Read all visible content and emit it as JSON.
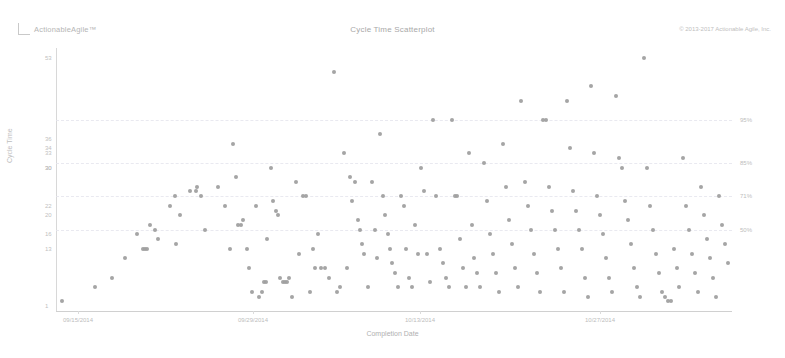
{
  "header": {
    "logo_text": "ActionableAgile™",
    "title": "Cycle Time Scatterplot",
    "copyright": "© 2013-2017 Actionable Agile, Inc."
  },
  "chart_data": {
    "type": "scatter",
    "title": "Cycle Time Scatterplot",
    "xlabel": "Completion Date",
    "ylabel": "Cycle Time",
    "grid": true,
    "legend": "none",
    "xlim": [
      "09/15/2014",
      "11/10/2014"
    ],
    "ylim": [
      0,
      55
    ],
    "x_tick_labels": [
      "09/15/2014",
      "09/29/2014",
      "10/13/2014",
      "10/27/2014"
    ],
    "x_tick_positions": [
      78,
      253,
      420,
      600
    ],
    "y_tick_labels": [
      "53",
      "36",
      "34",
      "30",
      "33",
      "30",
      "22",
      "20",
      "16",
      "13",
      "1"
    ],
    "y_tick_values": [
      53,
      36,
      34,
      30,
      33,
      30,
      22,
      20,
      16,
      13,
      1
    ],
    "percentile_lines": [
      {
        "label": "95%",
        "value": 40
      },
      {
        "label": "85%",
        "value": 31
      },
      {
        "label": "71%",
        "value": 24
      },
      {
        "label": "50%",
        "value": 17
      }
    ],
    "marker_color": "#a0a0a0",
    "marker_size": 4,
    "point_count": 178,
    "points": [
      [
        62,
        2
      ],
      [
        95,
        5
      ],
      [
        112,
        7
      ],
      [
        125,
        11
      ],
      [
        137,
        16
      ],
      [
        143,
        13
      ],
      [
        145,
        13
      ],
      [
        147,
        13
      ],
      [
        150,
        18
      ],
      [
        155,
        17
      ],
      [
        158,
        15
      ],
      [
        170,
        22
      ],
      [
        175,
        24
      ],
      [
        176,
        14
      ],
      [
        180,
        20
      ],
      [
        190,
        25
      ],
      [
        196,
        25
      ],
      [
        197,
        26
      ],
      [
        201,
        24
      ],
      [
        205,
        17
      ],
      [
        218,
        26
      ],
      [
        225,
        22
      ],
      [
        230,
        13
      ],
      [
        233,
        35
      ],
      [
        236,
        28
      ],
      [
        238,
        18
      ],
      [
        241,
        18
      ],
      [
        243,
        19
      ],
      [
        247,
        13
      ],
      [
        249,
        9
      ],
      [
        252,
        4
      ],
      [
        256,
        22
      ],
      [
        259,
        3
      ],
      [
        262,
        4
      ],
      [
        264,
        6
      ],
      [
        266,
        6
      ],
      [
        267,
        15
      ],
      [
        271,
        30
      ],
      [
        273,
        23
      ],
      [
        276,
        21
      ],
      [
        278,
        20
      ],
      [
        280,
        7
      ],
      [
        283,
        6
      ],
      [
        285,
        6
      ],
      [
        287,
        6
      ],
      [
        289,
        7
      ],
      [
        292,
        3
      ],
      [
        296,
        27
      ],
      [
        299,
        12
      ],
      [
        303,
        24
      ],
      [
        306,
        24
      ],
      [
        310,
        4
      ],
      [
        313,
        13
      ],
      [
        315,
        9
      ],
      [
        318,
        16
      ],
      [
        321,
        9
      ],
      [
        325,
        9
      ],
      [
        329,
        7
      ],
      [
        334,
        50
      ],
      [
        337,
        4
      ],
      [
        340,
        5
      ],
      [
        344,
        33
      ],
      [
        347,
        9
      ],
      [
        350,
        28
      ],
      [
        352,
        23
      ],
      [
        355,
        27
      ],
      [
        358,
        19
      ],
      [
        360,
        17
      ],
      [
        362,
        14
      ],
      [
        364,
        12
      ],
      [
        368,
        5
      ],
      [
        372,
        27
      ],
      [
        375,
        17
      ],
      [
        377,
        11
      ],
      [
        380,
        37
      ],
      [
        383,
        24
      ],
      [
        385,
        20
      ],
      [
        388,
        16
      ],
      [
        390,
        13
      ],
      [
        392,
        10
      ],
      [
        395,
        8
      ],
      [
        398,
        5
      ],
      [
        401,
        24
      ],
      [
        404,
        22
      ],
      [
        406,
        13
      ],
      [
        409,
        7
      ],
      [
        412,
        5
      ],
      [
        415,
        18
      ],
      [
        418,
        12
      ],
      [
        421,
        30
      ],
      [
        424,
        25
      ],
      [
        427,
        12
      ],
      [
        430,
        6
      ],
      [
        433,
        40
      ],
      [
        436,
        24
      ],
      [
        440,
        13
      ],
      [
        443,
        10
      ],
      [
        446,
        7
      ],
      [
        449,
        5
      ],
      [
        452,
        40
      ],
      [
        455,
        24
      ],
      [
        457,
        24
      ],
      [
        460,
        15
      ],
      [
        463,
        9
      ],
      [
        466,
        5
      ],
      [
        469,
        33
      ],
      [
        472,
        18
      ],
      [
        474,
        11
      ],
      [
        477,
        8
      ],
      [
        480,
        5
      ],
      [
        484,
        31
      ],
      [
        487,
        23
      ],
      [
        490,
        16
      ],
      [
        493,
        12
      ],
      [
        496,
        8
      ],
      [
        499,
        4
      ],
      [
        503,
        35
      ],
      [
        506,
        26
      ],
      [
        509,
        19
      ],
      [
        512,
        14
      ],
      [
        515,
        9
      ],
      [
        518,
        5
      ],
      [
        521,
        44
      ],
      [
        525,
        27
      ],
      [
        528,
        22
      ],
      [
        531,
        17
      ],
      [
        534,
        12
      ],
      [
        537,
        8
      ],
      [
        540,
        4
      ],
      [
        543,
        40
      ],
      [
        546,
        40
      ],
      [
        549,
        26
      ],
      [
        552,
        21
      ],
      [
        555,
        17
      ],
      [
        558,
        13
      ],
      [
        561,
        9
      ],
      [
        564,
        4
      ],
      [
        567,
        44
      ],
      [
        570,
        34
      ],
      [
        573,
        25
      ],
      [
        576,
        21
      ],
      [
        579,
        17
      ],
      [
        582,
        13
      ],
      [
        585,
        7
      ],
      [
        588,
        3
      ],
      [
        591,
        47
      ],
      [
        594,
        33
      ],
      [
        597,
        24
      ],
      [
        600,
        20
      ],
      [
        603,
        16
      ],
      [
        606,
        11
      ],
      [
        609,
        7
      ],
      [
        612,
        4
      ],
      [
        616,
        45
      ],
      [
        619,
        32
      ],
      [
        622,
        30
      ],
      [
        625,
        23
      ],
      [
        628,
        19
      ],
      [
        631,
        14
      ],
      [
        634,
        9
      ],
      [
        637,
        5
      ],
      [
        640,
        3
      ],
      [
        644,
        53
      ],
      [
        647,
        30
      ],
      [
        650,
        22
      ],
      [
        653,
        17
      ],
      [
        656,
        12
      ],
      [
        659,
        8
      ],
      [
        662,
        4
      ],
      [
        665,
        3
      ],
      [
        668,
        2
      ],
      [
        671,
        2
      ],
      [
        674,
        13
      ],
      [
        677,
        9
      ],
      [
        679,
        5
      ],
      [
        683,
        32
      ],
      [
        686,
        22
      ],
      [
        689,
        17
      ],
      [
        692,
        12
      ],
      [
        695,
        8
      ],
      [
        698,
        4
      ],
      [
        701,
        26
      ],
      [
        704,
        20
      ],
      [
        707,
        15
      ],
      [
        710,
        11
      ],
      [
        713,
        7
      ],
      [
        716,
        3
      ],
      [
        719,
        24
      ],
      [
        722,
        18
      ],
      [
        725,
        14
      ],
      [
        728,
        10
      ]
    ]
  }
}
